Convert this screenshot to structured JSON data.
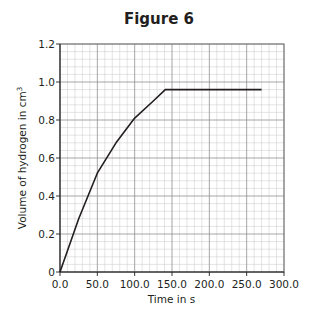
{
  "figure": {
    "title": "Figure 6"
  },
  "chart_data": {
    "type": "line",
    "title": "Figure 6",
    "xlabel": "Time in s",
    "ylabel": "Volume of hydrogen in cm³",
    "ylabel_main": "Volume of hydrogen in cm",
    "ylabel_sup": "3",
    "xlim": [
      0,
      300
    ],
    "ylim": [
      0,
      1.2
    ],
    "x_ticks": [
      "0.0",
      "50.0",
      "100.0",
      "150.0",
      "200.0",
      "250.0",
      "300.0"
    ],
    "y_ticks": [
      "0",
      "0.2",
      "0.4",
      "0.6",
      "0.8",
      "1.0",
      "1.2"
    ],
    "grid": true,
    "legend": null,
    "series": [
      {
        "name": "Volume of hydrogen",
        "x": [
          0,
          25,
          50,
          75,
          100,
          125,
          141,
          270
        ],
        "y": [
          0,
          0.28,
          0.52,
          0.68,
          0.81,
          0.9,
          0.96,
          0.96
        ]
      }
    ]
  }
}
